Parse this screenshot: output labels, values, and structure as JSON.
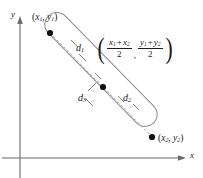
{
  "figure": {
    "type": "geometry-diagram",
    "axes": {
      "x_label": "x",
      "y_label": "y",
      "origin": {
        "x": 20,
        "y": 158
      },
      "x_axis_end": {
        "x": 186,
        "y": 158
      },
      "y_axis_end": {
        "x": 20,
        "y": 18
      },
      "color": "#6b6b6b"
    },
    "points": [
      {
        "name": "endpoint-1",
        "label_x": "x",
        "label_x_sub": "1",
        "label_y": "y",
        "label_y_sub": "1",
        "cx": 50,
        "cy": 33,
        "label_left": 32,
        "label_top": 13
      },
      {
        "name": "midpoint",
        "cx": 103,
        "cy": 87
      },
      {
        "name": "endpoint-2",
        "label_x": "x",
        "label_x_sub": "2",
        "label_y": "y",
        "label_y_sub": "2",
        "cx": 152,
        "cy": 137,
        "label_left": 158,
        "label_top": 134
      }
    ],
    "distances": [
      {
        "name": "d1",
        "base": "d",
        "sub": "1",
        "left": 76,
        "top": 43
      },
      {
        "name": "d2",
        "base": "d",
        "sub": "2",
        "left": 123,
        "top": 93
      },
      {
        "name": "d3",
        "base": "d",
        "sub": "3",
        "left": 78,
        "top": 93
      }
    ],
    "midpoint_formula": {
      "open_paren": "(",
      "close_paren": ")",
      "separator": ",",
      "first_fraction": {
        "num_a": "x",
        "num_a_sub": "1",
        "operator": "+",
        "num_b": "x",
        "num_b_sub": "2",
        "denominator": "2"
      },
      "second_fraction": {
        "num_a": "y",
        "num_a_sub": "1",
        "operator": "+",
        "num_b": "y",
        "num_b_sub": "2",
        "denominator": "2"
      }
    },
    "colors": {
      "ink": "#1a1a1a",
      "axis": "#6b6b6b",
      "capsule_outline": "#8a8a8a",
      "dashed_segment": "#9a9a9a",
      "leader": "#555555"
    }
  }
}
